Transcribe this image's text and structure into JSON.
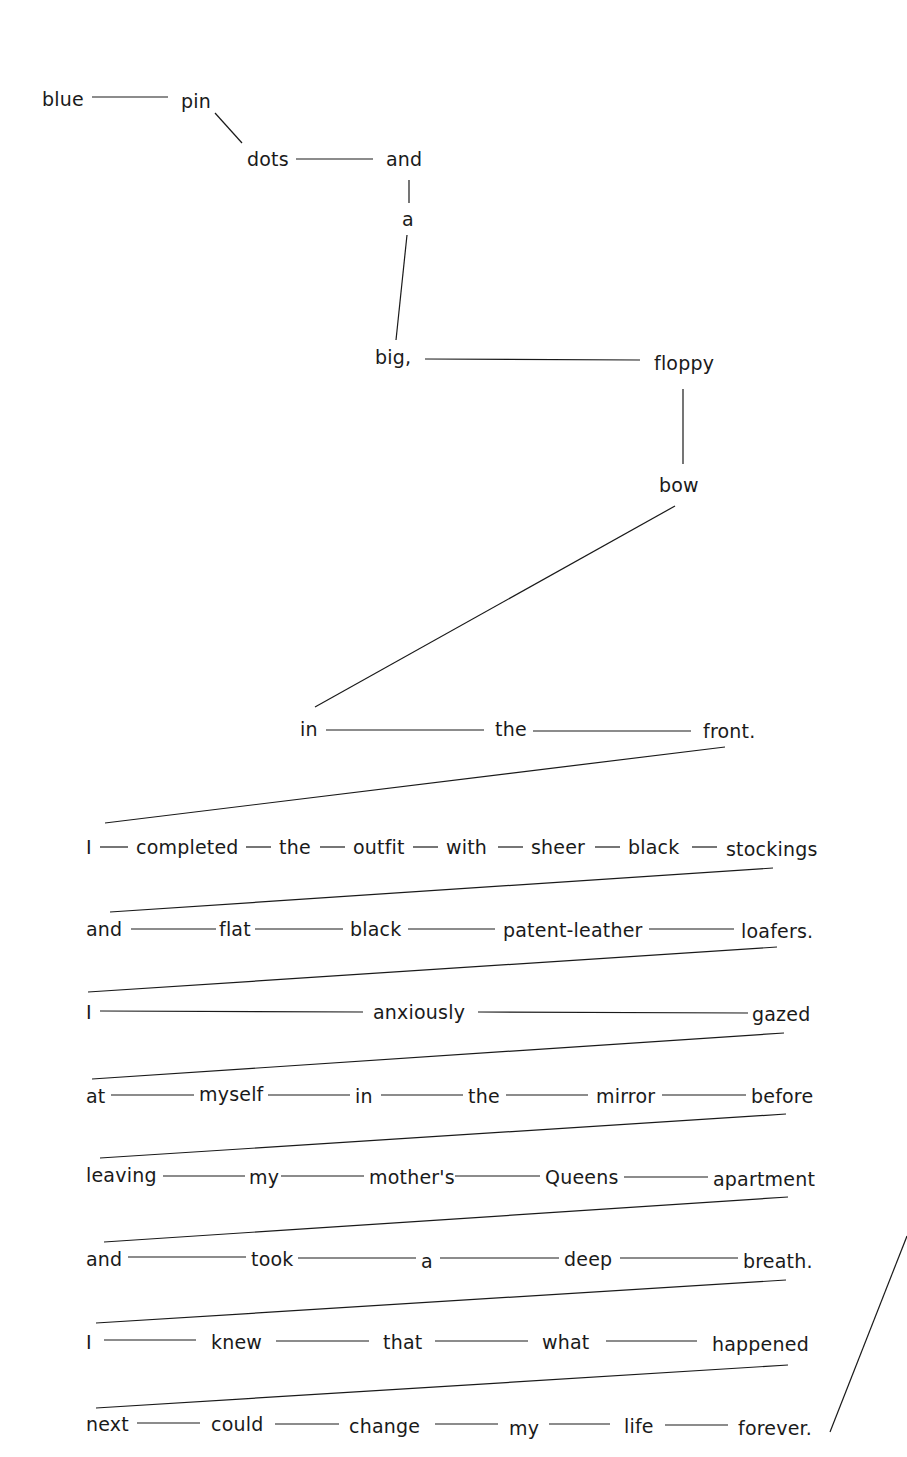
{
  "diagram": {
    "type": "concrete-poem-word-chain",
    "text_color": "#1a1a1a",
    "background": "#ffffff",
    "words": [
      {
        "id": "w1",
        "text": "blue",
        "x": 42,
        "y": 90
      },
      {
        "id": "w2",
        "text": "pin",
        "x": 181,
        "y": 92
      },
      {
        "id": "w3",
        "text": "dots",
        "x": 247,
        "y": 150
      },
      {
        "id": "w4",
        "text": "and",
        "x": 386,
        "y": 150
      },
      {
        "id": "w5",
        "text": "a",
        "x": 402,
        "y": 210
      },
      {
        "id": "w6",
        "text": "big,",
        "x": 375,
        "y": 348
      },
      {
        "id": "w7",
        "text": "floppy",
        "x": 654,
        "y": 354
      },
      {
        "id": "w8",
        "text": "bow",
        "x": 659,
        "y": 476
      },
      {
        "id": "w9",
        "text": "in",
        "x": 300,
        "y": 720
      },
      {
        "id": "w10",
        "text": "the",
        "x": 495,
        "y": 720
      },
      {
        "id": "w11",
        "text": "front.",
        "x": 703,
        "y": 722
      },
      {
        "id": "r1a",
        "text": "I",
        "x": 86,
        "y": 838
      },
      {
        "id": "r1b",
        "text": "completed",
        "x": 136,
        "y": 838
      },
      {
        "id": "r1c",
        "text": "the",
        "x": 279,
        "y": 838
      },
      {
        "id": "r1d",
        "text": "outfit",
        "x": 353,
        "y": 838
      },
      {
        "id": "r1e",
        "text": "with",
        "x": 446,
        "y": 838
      },
      {
        "id": "r1f",
        "text": "sheer",
        "x": 531,
        "y": 838
      },
      {
        "id": "r1g",
        "text": "black",
        "x": 628,
        "y": 838
      },
      {
        "id": "r1h",
        "text": "stockings",
        "x": 726,
        "y": 840
      },
      {
        "id": "r2a",
        "text": "and",
        "x": 86,
        "y": 920
      },
      {
        "id": "r2b",
        "text": "flat",
        "x": 219,
        "y": 920
      },
      {
        "id": "r2c",
        "text": "black",
        "x": 350,
        "y": 920
      },
      {
        "id": "r2d",
        "text": "patent-leather",
        "x": 503,
        "y": 921
      },
      {
        "id": "r2e",
        "text": "loafers.",
        "x": 741,
        "y": 922
      },
      {
        "id": "r3a",
        "text": "I",
        "x": 86,
        "y": 1003
      },
      {
        "id": "r3b",
        "text": "anxiously",
        "x": 373,
        "y": 1003
      },
      {
        "id": "r3c",
        "text": "gazed",
        "x": 752,
        "y": 1005
      },
      {
        "id": "r4a",
        "text": "at",
        "x": 86,
        "y": 1087
      },
      {
        "id": "r4b",
        "text": "myself",
        "x": 199,
        "y": 1085
      },
      {
        "id": "r4c",
        "text": "in",
        "x": 355,
        "y": 1087
      },
      {
        "id": "r4d",
        "text": "the",
        "x": 468,
        "y": 1087
      },
      {
        "id": "r4e",
        "text": "mirror",
        "x": 596,
        "y": 1087
      },
      {
        "id": "r4f",
        "text": "before",
        "x": 751,
        "y": 1087
      },
      {
        "id": "r5a",
        "text": "leaving",
        "x": 86,
        "y": 1166
      },
      {
        "id": "r5b",
        "text": "my",
        "x": 249,
        "y": 1168
      },
      {
        "id": "r5c",
        "text": "mother's",
        "x": 369,
        "y": 1168
      },
      {
        "id": "r5d",
        "text": "Queens",
        "x": 545,
        "y": 1168
      },
      {
        "id": "r5e",
        "text": "apartment",
        "x": 713,
        "y": 1170
      },
      {
        "id": "r6a",
        "text": "and",
        "x": 86,
        "y": 1250
      },
      {
        "id": "r6b",
        "text": "took",
        "x": 251,
        "y": 1250
      },
      {
        "id": "r6c",
        "text": "a",
        "x": 421,
        "y": 1252
      },
      {
        "id": "r6d",
        "text": "deep",
        "x": 564,
        "y": 1250
      },
      {
        "id": "r6e",
        "text": "breath.",
        "x": 743,
        "y": 1252
      },
      {
        "id": "r7a",
        "text": "I",
        "x": 86,
        "y": 1333
      },
      {
        "id": "r7b",
        "text": "knew",
        "x": 211,
        "y": 1333
      },
      {
        "id": "r7c",
        "text": "that",
        "x": 383,
        "y": 1333
      },
      {
        "id": "r7d",
        "text": "what",
        "x": 542,
        "y": 1333
      },
      {
        "id": "r7e",
        "text": "happened",
        "x": 712,
        "y": 1335
      },
      {
        "id": "r8a",
        "text": "next",
        "x": 86,
        "y": 1415
      },
      {
        "id": "r8b",
        "text": "could",
        "x": 211,
        "y": 1415
      },
      {
        "id": "r8c",
        "text": "change",
        "x": 349,
        "y": 1417
      },
      {
        "id": "r8d",
        "text": "my",
        "x": 509,
        "y": 1419
      },
      {
        "id": "r8e",
        "text": "life",
        "x": 624,
        "y": 1417
      },
      {
        "id": "r8f",
        "text": "forever.",
        "x": 738,
        "y": 1419
      }
    ],
    "lines": [
      {
        "x1": 92,
        "y1": 97,
        "x2": 168,
        "y2": 97
      },
      {
        "x1": 215,
        "y1": 113,
        "x2": 242,
        "y2": 143
      },
      {
        "x1": 296,
        "y1": 159,
        "x2": 373,
        "y2": 159
      },
      {
        "x1": 409,
        "y1": 180,
        "x2": 409,
        "y2": 203
      },
      {
        "x1": 407,
        "y1": 235,
        "x2": 396,
        "y2": 340
      },
      {
        "x1": 425,
        "y1": 359,
        "x2": 640,
        "y2": 360
      },
      {
        "x1": 683,
        "y1": 389,
        "x2": 683,
        "y2": 464
      },
      {
        "x1": 675,
        "y1": 506,
        "x2": 315,
        "y2": 707
      },
      {
        "x1": 326,
        "y1": 730,
        "x2": 484,
        "y2": 730
      },
      {
        "x1": 533,
        "y1": 731,
        "x2": 691,
        "y2": 731
      },
      {
        "x1": 725,
        "y1": 747,
        "x2": 105,
        "y2": 823
      },
      {
        "x1": 100,
        "y1": 847,
        "x2": 128,
        "y2": 847
      },
      {
        "x1": 246,
        "y1": 847,
        "x2": 271,
        "y2": 847
      },
      {
        "x1": 320,
        "y1": 847,
        "x2": 345,
        "y2": 847
      },
      {
        "x1": 413,
        "y1": 847,
        "x2": 438,
        "y2": 847
      },
      {
        "x1": 498,
        "y1": 847,
        "x2": 523,
        "y2": 847
      },
      {
        "x1": 595,
        "y1": 847,
        "x2": 620,
        "y2": 847
      },
      {
        "x1": 692,
        "y1": 847,
        "x2": 717,
        "y2": 847
      },
      {
        "x1": 773,
        "y1": 868,
        "x2": 110,
        "y2": 912
      },
      {
        "x1": 131,
        "y1": 929,
        "x2": 216,
        "y2": 929
      },
      {
        "x1": 255,
        "y1": 929,
        "x2": 343,
        "y2": 929
      },
      {
        "x1": 408,
        "y1": 929,
        "x2": 495,
        "y2": 929
      },
      {
        "x1": 649,
        "y1": 929,
        "x2": 734,
        "y2": 929
      },
      {
        "x1": 777,
        "y1": 947,
        "x2": 88,
        "y2": 992
      },
      {
        "x1": 100,
        "y1": 1011,
        "x2": 363,
        "y2": 1012
      },
      {
        "x1": 478,
        "y1": 1012,
        "x2": 748,
        "y2": 1013
      },
      {
        "x1": 784,
        "y1": 1033,
        "x2": 92,
        "y2": 1079
      },
      {
        "x1": 111,
        "y1": 1095,
        "x2": 194,
        "y2": 1095
      },
      {
        "x1": 268,
        "y1": 1095,
        "x2": 350,
        "y2": 1095
      },
      {
        "x1": 381,
        "y1": 1095,
        "x2": 463,
        "y2": 1095
      },
      {
        "x1": 506,
        "y1": 1095,
        "x2": 588,
        "y2": 1095
      },
      {
        "x1": 662,
        "y1": 1095,
        "x2": 746,
        "y2": 1095
      },
      {
        "x1": 786,
        "y1": 1114,
        "x2": 100,
        "y2": 1158
      },
      {
        "x1": 163,
        "y1": 1176,
        "x2": 245,
        "y2": 1176
      },
      {
        "x1": 281,
        "y1": 1176,
        "x2": 364,
        "y2": 1176
      },
      {
        "x1": 455,
        "y1": 1176,
        "x2": 540,
        "y2": 1176
      },
      {
        "x1": 624,
        "y1": 1177,
        "x2": 708,
        "y2": 1177
      },
      {
        "x1": 788,
        "y1": 1197,
        "x2": 104,
        "y2": 1242
      },
      {
        "x1": 128,
        "y1": 1257,
        "x2": 246,
        "y2": 1257
      },
      {
        "x1": 298,
        "y1": 1258,
        "x2": 416,
        "y2": 1258
      },
      {
        "x1": 440,
        "y1": 1258,
        "x2": 559,
        "y2": 1258
      },
      {
        "x1": 620,
        "y1": 1258,
        "x2": 738,
        "y2": 1258
      },
      {
        "x1": 786,
        "y1": 1280,
        "x2": 96,
        "y2": 1323
      },
      {
        "x1": 104,
        "y1": 1340,
        "x2": 196,
        "y2": 1340
      },
      {
        "x1": 276,
        "y1": 1341,
        "x2": 369,
        "y2": 1341
      },
      {
        "x1": 435,
        "y1": 1341,
        "x2": 528,
        "y2": 1341
      },
      {
        "x1": 606,
        "y1": 1341,
        "x2": 697,
        "y2": 1341
      },
      {
        "x1": 788,
        "y1": 1365,
        "x2": 96,
        "y2": 1408
      },
      {
        "x1": 137,
        "y1": 1423,
        "x2": 200,
        "y2": 1423
      },
      {
        "x1": 275,
        "y1": 1424,
        "x2": 339,
        "y2": 1424
      },
      {
        "x1": 435,
        "y1": 1424,
        "x2": 498,
        "y2": 1424
      },
      {
        "x1": 549,
        "y1": 1424,
        "x2": 610,
        "y2": 1424
      },
      {
        "x1": 665,
        "y1": 1425,
        "x2": 728,
        "y2": 1425
      },
      {
        "x1": 907,
        "y1": 1236,
        "x2": 830,
        "y2": 1432
      }
    ]
  }
}
